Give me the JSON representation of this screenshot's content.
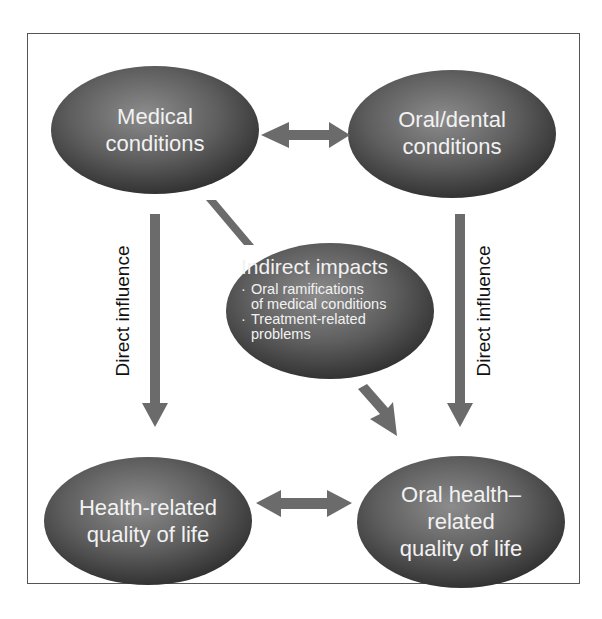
{
  "diagram": {
    "nodes": {
      "medical": {
        "label_line1": "Medical",
        "label_line2": "conditions"
      },
      "oral_dental": {
        "label_line1": "Oral/dental",
        "label_line2": "conditions"
      },
      "indirect": {
        "title": "Indirect impacts",
        "bullets": [
          {
            "line1": "Oral ramifications",
            "line2": "of medical conditions"
          },
          {
            "line1": "Treatment-related",
            "line2": "problems"
          }
        ]
      },
      "hrqol": {
        "label_line1": "Health-related",
        "label_line2": "quality of life"
      },
      "ohrqol": {
        "label_line1": "Oral health–",
        "label_line2": "related",
        "label_line3": "quality of life"
      }
    },
    "edges": {
      "left_vertical_label": "Direct influence",
      "right_vertical_label": "Direct influence"
    },
    "colors": {
      "node_fill_dark": "#3a3a3a",
      "node_fill_light": "#8a8a8a",
      "arrow": "#6b6b6b",
      "node_text": "#f2f2f2",
      "frame_border": "#555555"
    }
  }
}
